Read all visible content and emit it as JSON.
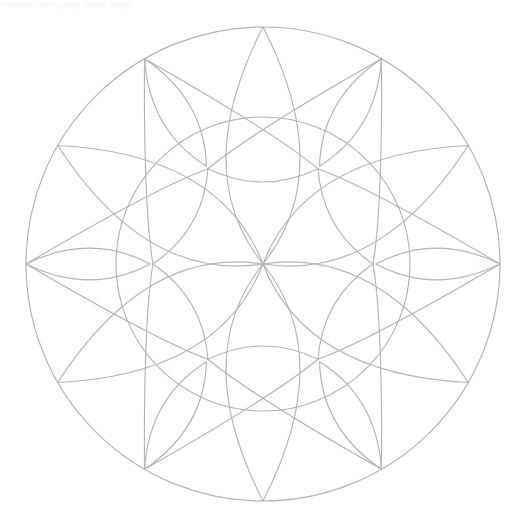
{
  "page": {
    "title": "Mandala Coloring Page",
    "kind": "line-art-mandala",
    "canvas_width": 522,
    "canvas_height": 529,
    "background_color": "#ffffff"
  },
  "watermark": {
    "text": "mandala coloring page outline design",
    "color": "#f4f4f6"
  },
  "drawing": {
    "stroke_color": "#b4b4b4",
    "stroke_width": 1.15,
    "fill": "none",
    "center_x": 263,
    "center_y": 264,
    "outer_radius": 237,
    "ring_radius": 147,
    "inner_hub_radius": 96,
    "symmetry_order": 6,
    "description": "Six-fold symmetric mandala: outer boundary circle, one concentric inner ring, six large lens petals radiating from the center to the outer circle, six narrow spear petals on the alternating axes reaching the rim, and six curved triangular lattice cells between the inner ring and the hub."
  },
  "layers": [
    {
      "name": "outer-circle",
      "kind": "circle",
      "radius": 237
    },
    {
      "name": "inner-ring",
      "kind": "circle",
      "radius": 147
    },
    {
      "name": "large-petals",
      "kind": "lens",
      "count": 6,
      "angles": [
        0,
        60,
        120,
        180,
        240,
        300
      ],
      "inner": 0,
      "outer": 237,
      "bulge": 0.42
    },
    {
      "name": "spear-petals",
      "kind": "lens",
      "count": 6,
      "angles": [
        30,
        90,
        150,
        210,
        270,
        330
      ],
      "inner": 147,
      "outer": 237,
      "bulge": 0.3
    },
    {
      "name": "lattice-arcs",
      "kind": "arc-web",
      "count": 12,
      "radius_from": 96,
      "radius_to": 147
    },
    {
      "name": "spoke-arcs",
      "kind": "arc",
      "count": 6,
      "angles": [
        30,
        90,
        150,
        210,
        270,
        330
      ],
      "radius_from": 147,
      "radius_to": 237
    }
  ]
}
